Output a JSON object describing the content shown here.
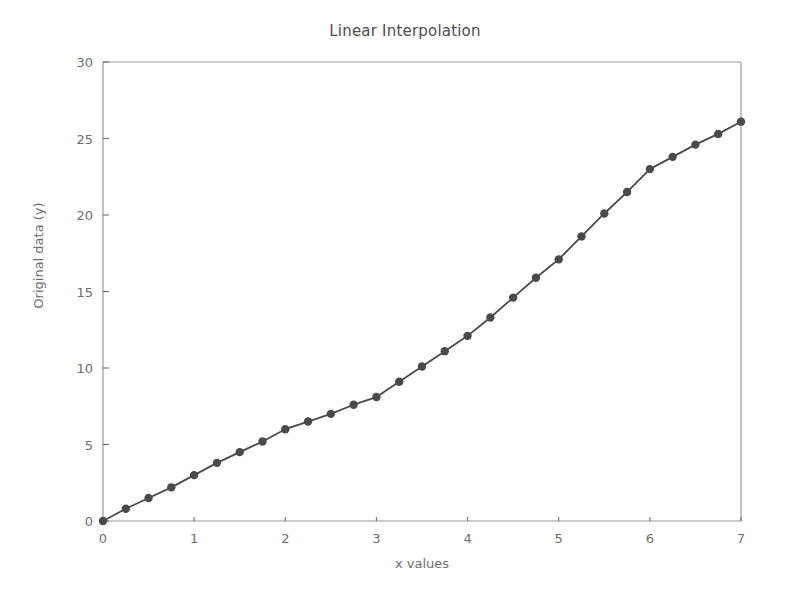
{
  "chart_data": {
    "type": "line",
    "title": "Linear Interpolation",
    "xlabel": "x values",
    "ylabel": "Original data (y)",
    "xlim": [
      0,
      7
    ],
    "ylim": [
      0,
      30
    ],
    "xticks": [
      0,
      1,
      2,
      3,
      4,
      5,
      6,
      7
    ],
    "yticks": [
      0,
      5,
      10,
      15,
      20,
      25,
      30
    ],
    "grid": false,
    "legend": null,
    "marker": "circle",
    "line_color": "#4a4a4a",
    "marker_color": "#4a4a4a",
    "series": [
      {
        "name": "Original data",
        "x": [
          0,
          0.25,
          0.5,
          0.75,
          1.0,
          1.25,
          1.5,
          1.75,
          2.0,
          2.25,
          2.5,
          2.75,
          3.0,
          3.25,
          3.5,
          3.75,
          4.0,
          4.25,
          4.5,
          4.75,
          5.0,
          5.25,
          5.5,
          5.75,
          6.0,
          6.25,
          6.5,
          6.75,
          7.0
        ],
        "values": [
          0.0,
          0.8,
          1.5,
          2.2,
          3.0,
          3.8,
          4.5,
          5.2,
          6.0,
          6.5,
          7.0,
          7.6,
          8.1,
          9.1,
          10.1,
          11.1,
          12.1,
          13.3,
          14.6,
          15.9,
          17.1,
          18.6,
          20.1,
          21.5,
          23.0,
          23.8,
          24.6,
          25.3,
          26.1
        ]
      }
    ]
  },
  "axes": {
    "tick_color": "#6e6e6e",
    "spine_color": "#9a9a9a"
  }
}
